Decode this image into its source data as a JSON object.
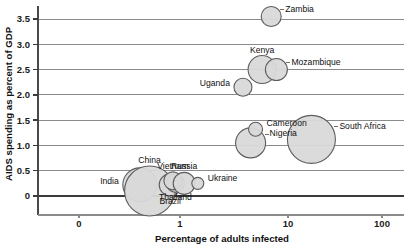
{
  "chart_data": {
    "type": "scatter",
    "title": "",
    "xlabel": "Percentage of adults infected",
    "ylabel": "AIDS spending as percent of GDP",
    "xscale": "log",
    "xtick_labels": [
      "0",
      "1",
      "10",
      "100"
    ],
    "ytick_labels": [
      "0",
      "0.5",
      "1.0",
      "1.5",
      "2.0",
      "2.5",
      "3.0",
      "3.5"
    ],
    "ylim": [
      0,
      3.75
    ],
    "grid": "horizontal",
    "legend": "none",
    "note": "Bubble area encodes a third variable (number of people living with HIV/AIDS); x uses a logarithmic scale.",
    "points": [
      {
        "label": "India",
        "x": 0.4,
        "y": 0.22,
        "size": 17,
        "label_pos": "left"
      },
      {
        "label": "China",
        "x": 0.5,
        "y": 0.1,
        "size": 25,
        "label_pos": "top"
      },
      {
        "label": "Brazil",
        "x": 0.8,
        "y": 0.22,
        "size": 11,
        "label_pos": "bottom"
      },
      {
        "label": "Thailand",
        "x": 0.9,
        "y": 0.25,
        "size": 9,
        "label_pos": "bottom"
      },
      {
        "label": "Vietnam",
        "x": 0.85,
        "y": 0.3,
        "size": 9,
        "label_pos": "top"
      },
      {
        "label": "Russia",
        "x": 1.1,
        "y": 0.25,
        "size": 11,
        "label_pos": "top"
      },
      {
        "label": "Ukraine",
        "x": 1.5,
        "y": 0.25,
        "size": 6,
        "label_pos": "right"
      },
      {
        "label": "Nigeria",
        "x": 5.0,
        "y": 1.05,
        "size": 15,
        "label_pos": "right"
      },
      {
        "label": "Cameroon",
        "x": 5.6,
        "y": 1.32,
        "size": 7,
        "label_pos": "right"
      },
      {
        "label": "Uganda",
        "x": 4.2,
        "y": 2.15,
        "size": 9,
        "label_pos": "left"
      },
      {
        "label": "Kenya",
        "x": 6.5,
        "y": 2.5,
        "size": 14,
        "label_pos": "top"
      },
      {
        "label": "Mozambique",
        "x": 9.0,
        "y": 2.5,
        "size": 11,
        "label_pos": "right"
      },
      {
        "label": "Zambia",
        "x": 8.0,
        "y": 3.55,
        "size": 10,
        "label_pos": "right"
      },
      {
        "label": "South Africa",
        "x": 20.0,
        "y": 1.12,
        "size": 24,
        "label_pos": "right"
      }
    ]
  }
}
